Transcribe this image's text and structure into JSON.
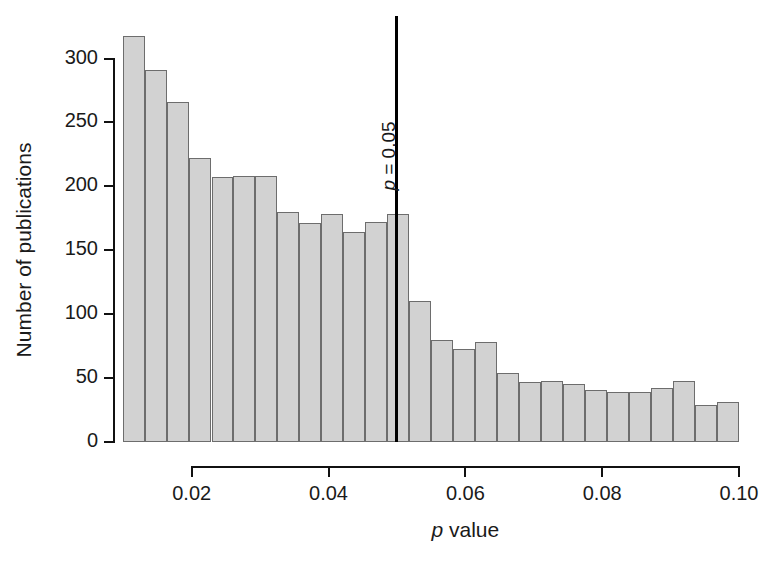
{
  "chart_data": {
    "type": "bar",
    "title": "",
    "subtitle": "",
    "xlabel": "p value",
    "xlabel_italic_prefix": "p",
    "xlabel_rest": " value",
    "ylabel": "Number of publications",
    "xlim": [
      0.01,
      0.1
    ],
    "ylim": [
      0,
      320
    ],
    "grid": false,
    "legend": null,
    "bin_width": 0.0032,
    "x_ticks": [
      0.02,
      0.04,
      0.06,
      0.08,
      0.1
    ],
    "x_tick_labels": [
      "0.02",
      "0.04",
      "0.06",
      "0.08",
      "0.10"
    ],
    "y_ticks": [
      0,
      50,
      100,
      150,
      200,
      250,
      300
    ],
    "y_tick_labels": [
      "0",
      "50",
      "100",
      "150",
      "200",
      "250",
      "300"
    ],
    "bin_starts": [
      0.01,
      0.0132,
      0.0164,
      0.0196,
      0.0229,
      0.0261,
      0.0293,
      0.0325,
      0.0357,
      0.0389,
      0.0421,
      0.0454,
      0.0486,
      0.0518,
      0.055,
      0.0582,
      0.0614,
      0.0646,
      0.0679,
      0.0711,
      0.0743,
      0.0775,
      0.0807,
      0.0839,
      0.0871,
      0.0904,
      0.0936,
      0.0968
    ],
    "values": [
      318,
      291,
      266,
      222,
      207,
      208,
      208,
      180,
      171,
      178,
      164,
      172,
      178,
      110,
      80,
      73,
      78,
      54,
      47,
      48,
      45,
      41,
      39,
      39,
      42,
      48,
      29,
      31
    ],
    "annotations": [
      {
        "name": "p-threshold",
        "text": "p = 0.05",
        "italic_prefix": "p",
        "rest": " = 0.05",
        "x": 0.05,
        "orientation": "vertical"
      }
    ],
    "colors": {
      "bar_fill": "#d2d2d2",
      "bar_stroke": "#6d6d6d",
      "axis": "#111111",
      "annotation_line": "#000000",
      "background": "#ffffff"
    }
  }
}
